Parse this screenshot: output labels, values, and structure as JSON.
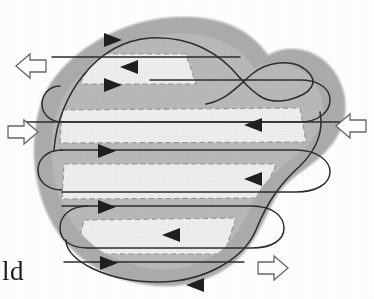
{
  "figure": {
    "kind": "boustrophedon-coverage-path-diagram",
    "background_color": "#ffffff",
    "region": {
      "name": "irregular-work-region",
      "outer_fill": "#a9a9a9",
      "outer_stroke": "#9a9a9a",
      "inner_fill": "#b4b4b4",
      "strip_fill": "#e6e6e6",
      "strip_dash_stroke": "#8d8d8d"
    },
    "path": {
      "name": "serpentine-sweep-path",
      "stroke": "#2b2b2b",
      "stroke_width": 1.6,
      "pass_count": 8,
      "arrowhead_fill": "#1f1f1f",
      "passes": [
        {
          "index": 1,
          "y": 44,
          "direction": "right",
          "arrow_x": 118
        },
        {
          "index": 2,
          "y": 72,
          "direction": "left",
          "arrow_x": 132
        },
        {
          "index": 3,
          "y": 100,
          "direction": "right",
          "arrow_x": 118
        },
        {
          "index": 4,
          "y": 128,
          "direction": "left",
          "arrow_x": 250
        },
        {
          "index": 5,
          "y": 156,
          "direction": "right",
          "arrow_x": 113
        },
        {
          "index": 6,
          "y": 184,
          "direction": "left",
          "arrow_x": 250
        },
        {
          "index": 7,
          "y": 212,
          "direction": "right",
          "arrow_x": 113
        },
        {
          "index": 8,
          "y": 240,
          "direction": "left",
          "arrow_x": 166
        },
        {
          "index": 9,
          "y": 268,
          "direction": "right",
          "arrow_x": 113
        },
        {
          "index": 10,
          "y": 288,
          "direction": "left",
          "arrow_x": 196
        }
      ]
    },
    "strips": [
      {
        "name": "strip-1",
        "label": "",
        "x": 78,
        "y": 52,
        "width": 112,
        "height": 30
      },
      {
        "name": "strip-2",
        "label": "",
        "x": 62,
        "y": 110,
        "width": 248,
        "height": 32
      },
      {
        "name": "strip-3",
        "label": "",
        "x": 62,
        "y": 166,
        "width": 218,
        "height": 34
      },
      {
        "name": "strip-4",
        "label": "",
        "x": 78,
        "y": 222,
        "width": 168,
        "height": 34
      }
    ],
    "flow_arrows": [
      {
        "name": "flow-arrow-top-left",
        "glyph": "left-block-arrow",
        "direction": "left",
        "x": 16,
        "y": 52,
        "stroke": "#5a5a5a"
      },
      {
        "name": "flow-arrow-middle-left",
        "glyph": "right-block-arrow",
        "direction": "right",
        "x": 6,
        "y": 120,
        "stroke": "#5a5a5a"
      },
      {
        "name": "flow-arrow-middle-right",
        "glyph": "left-block-arrow",
        "direction": "left",
        "x": 338,
        "y": 112,
        "stroke": "#5a5a5a"
      },
      {
        "name": "flow-arrow-bottom-right",
        "glyph": "right-block-arrow",
        "direction": "right",
        "x": 250,
        "y": 254,
        "stroke": "#5a5a5a"
      }
    ],
    "caption_fragment": "ld"
  }
}
